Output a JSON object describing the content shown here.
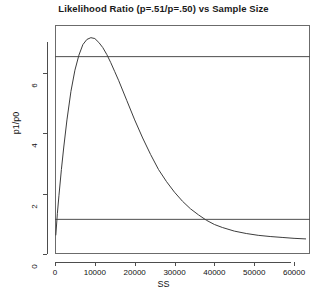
{
  "chart_data": {
    "type": "line",
    "title": "Likelihood Ratio (p=.51/p=.50) vs Sample Size",
    "xlabel": "SS",
    "ylabel": "p1/p0",
    "xlim": [
      0,
      64000
    ],
    "ylim": [
      0,
      7.6
    ],
    "grid": false,
    "legend": null,
    "xticks": [
      0,
      10000,
      20000,
      30000,
      40000,
      50000,
      60000
    ],
    "xticklabels": [
      "0",
      "10000",
      "20000",
      "30000",
      "40000",
      "50000",
      "60000"
    ],
    "yticks": [
      0,
      2,
      4,
      6
    ],
    "yticklabels": [
      "0",
      "2",
      "4",
      "6"
    ],
    "series": [
      {
        "name": "likelihood-ratio-curve",
        "color": "#3d3d3d",
        "x": [
          200,
          600,
          1000,
          1600,
          2200,
          3000,
          4000,
          5000,
          6000,
          7000,
          8000,
          9000,
          10000,
          11000,
          12000,
          13000,
          14000,
          15000,
          16000,
          18000,
          20000,
          22000,
          24000,
          26000,
          28000,
          30000,
          32000,
          34000,
          36000,
          38000,
          40000,
          42000,
          45000,
          48000,
          51000,
          54000,
          57000,
          60000,
          63000
        ],
        "y": [
          0.62,
          1.35,
          1.95,
          2.8,
          3.55,
          4.45,
          5.4,
          6.1,
          6.6,
          6.95,
          7.12,
          7.18,
          7.15,
          7.02,
          6.85,
          6.62,
          6.35,
          6.05,
          5.75,
          5.1,
          4.45,
          3.85,
          3.3,
          2.8,
          2.4,
          2.05,
          1.75,
          1.5,
          1.3,
          1.12,
          0.98,
          0.88,
          0.76,
          0.68,
          0.62,
          0.58,
          0.55,
          0.52,
          0.5
        ]
      }
    ],
    "reference_lines": [
      {
        "name": "upper-threshold-line",
        "orientation": "horizontal",
        "value": 6.55,
        "color": "#4d4d4d"
      },
      {
        "name": "lower-threshold-line",
        "orientation": "horizontal",
        "value": 1.15,
        "color": "#4d4d4d"
      }
    ]
  }
}
